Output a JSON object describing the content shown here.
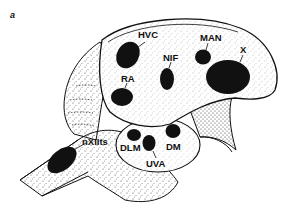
{
  "figure": {
    "panel_label": "a",
    "colors": {
      "ink": "#111111",
      "stipple": "#333333",
      "background": "#ffffff"
    }
  },
  "nuclei": [
    {
      "id": "hvc",
      "label": "HVC"
    },
    {
      "id": "man",
      "label": "MAN"
    },
    {
      "id": "nif",
      "label": "NIF"
    },
    {
      "id": "x",
      "label": "X"
    },
    {
      "id": "ra",
      "label": "RA"
    },
    {
      "id": "nxiits",
      "label": "nXIIts"
    },
    {
      "id": "dlm",
      "label": "DLM"
    },
    {
      "id": "dm",
      "label": "DM"
    },
    {
      "id": "uva",
      "label": "UVA"
    }
  ]
}
